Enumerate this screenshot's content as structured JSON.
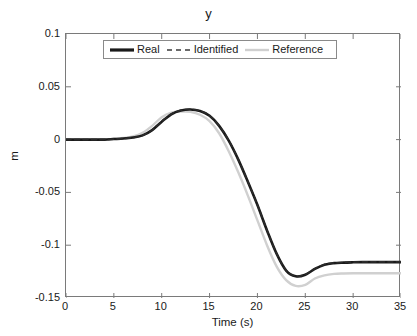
{
  "chart_data": {
    "type": "line",
    "title": "y",
    "xlabel": "Time (s)",
    "ylabel": "m",
    "xlim": [
      0,
      35
    ],
    "ylim": [
      -0.15,
      0.1
    ],
    "xticks": [
      0,
      5,
      10,
      15,
      20,
      25,
      30,
      35
    ],
    "xtick_labels": [
      "0",
      "5",
      "10",
      "15",
      "20",
      "25",
      "30",
      "35"
    ],
    "yticks": [
      0.1,
      0.05,
      0,
      -0.05,
      -0.1,
      -0.15
    ],
    "ytick_labels": [
      "0.1",
      "0.05",
      "0",
      "-0.05",
      "-0.1",
      "-0.15"
    ],
    "grid": false,
    "legend_position": "top-center",
    "x": [
      0,
      1,
      2,
      3,
      4,
      5,
      6,
      7,
      8,
      9,
      10,
      11,
      12,
      13,
      14,
      15,
      16,
      17,
      18,
      19,
      20,
      21,
      22,
      23,
      24,
      25,
      26,
      27,
      28,
      29,
      30,
      31,
      32,
      33,
      34,
      35
    ],
    "series": [
      {
        "name": "Real",
        "color": "#1a1a1a",
        "style": "solid",
        "width": 2.6,
        "values": [
          0.0,
          0.0,
          0.0,
          0.0,
          0.0,
          0.0005,
          0.001,
          0.002,
          0.004,
          0.009,
          0.017,
          0.024,
          0.0275,
          0.0285,
          0.027,
          0.0225,
          0.013,
          -0.001,
          -0.019,
          -0.04,
          -0.062,
          -0.086,
          -0.108,
          -0.124,
          -0.1295,
          -0.128,
          -0.1225,
          -0.1185,
          -0.117,
          -0.1165,
          -0.1162,
          -0.116,
          -0.116,
          -0.116,
          -0.116,
          -0.116
        ]
      },
      {
        "name": "Identified",
        "color": "#2b2b2b",
        "style": "dashed",
        "width": 1.6,
        "values": [
          0.0,
          0.0,
          0.0,
          0.0,
          0.0,
          0.0005,
          0.001,
          0.002,
          0.004,
          0.009,
          0.0172,
          0.0242,
          0.0277,
          0.0287,
          0.0272,
          0.0227,
          0.0132,
          -0.0008,
          -0.0188,
          -0.0398,
          -0.0618,
          -0.0858,
          -0.1078,
          -0.1238,
          -0.1293,
          -0.1278,
          -0.1223,
          -0.1183,
          -0.1168,
          -0.1163,
          -0.116,
          -0.1158,
          -0.1158,
          -0.1158,
          -0.1158,
          -0.1158
        ]
      },
      {
        "name": "Reference",
        "color": "#d0d0d0",
        "style": "solid",
        "width": 2.4,
        "values": [
          0.0,
          0.0,
          0.0,
          0.0,
          0.0,
          0.0008,
          0.0015,
          0.003,
          0.0065,
          0.013,
          0.0212,
          0.0255,
          0.0265,
          0.0262,
          0.0235,
          0.0175,
          0.006,
          -0.011,
          -0.031,
          -0.053,
          -0.0765,
          -0.1,
          -0.12,
          -0.133,
          -0.1385,
          -0.1375,
          -0.1315,
          -0.1285,
          -0.1272,
          -0.1268,
          -0.1266,
          -0.1265,
          -0.1265,
          -0.1265,
          -0.1265,
          -0.1265
        ]
      }
    ]
  },
  "legend": {
    "items": [
      {
        "label": "Real"
      },
      {
        "label": "Identified"
      },
      {
        "label": "Reference"
      }
    ]
  }
}
